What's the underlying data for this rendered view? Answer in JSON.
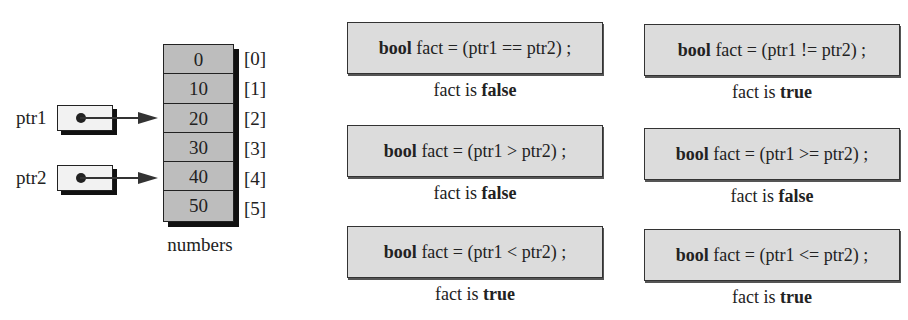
{
  "array": {
    "name": "numbers",
    "values": [
      "0",
      "10",
      "20",
      "30",
      "40",
      "50"
    ],
    "indices": [
      "[0]",
      "[1]",
      "[2]",
      "[3]",
      "[4]",
      "[5]"
    ]
  },
  "pointers": [
    {
      "name": "ptr1",
      "points_to_index": 2
    },
    {
      "name": "ptr2",
      "points_to_index": 4
    }
  ],
  "comparisons": [
    {
      "keyword": "bool",
      "expr": " fact = (ptr1 == ptr2) ;",
      "result_prefix": "fact is ",
      "result_value": "false"
    },
    {
      "keyword": "bool",
      "expr": " fact = (ptr1 != ptr2) ;",
      "result_prefix": "fact is ",
      "result_value": "true"
    },
    {
      "keyword": "bool",
      "expr": " fact = (ptr1 > ptr2) ;",
      "result_prefix": "fact is ",
      "result_value": "false"
    },
    {
      "keyword": "bool",
      "expr": " fact = (ptr1 >= ptr2) ;",
      "result_prefix": "fact is ",
      "result_value": "false"
    },
    {
      "keyword": "bool",
      "expr": " fact = (ptr1 < ptr2) ;",
      "result_prefix": "fact is ",
      "result_value": "true"
    },
    {
      "keyword": "bool",
      "expr": " fact = (ptr1 <= ptr2) ;",
      "result_prefix": "fact is ",
      "result_value": "true"
    }
  ],
  "colors": {
    "array_fill": "#bdbdbd",
    "comparison_fill": "#dcdcdc",
    "pointer_fill": "#f2f2f2",
    "shadow": "#111111"
  }
}
